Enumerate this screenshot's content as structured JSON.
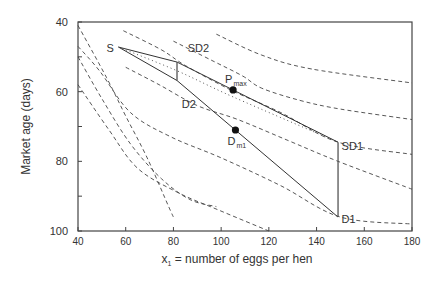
{
  "chart_data": {
    "type": "line",
    "title": "",
    "xlabel": "x",
    "xlabel_sub": "1",
    "xlabel_rest": " = number of eggs per hen",
    "ylabel": "Market age (days)",
    "xlim": [
      40,
      180
    ],
    "ylim": [
      40,
      100
    ],
    "y_inverted": true,
    "x_ticks": [
      40,
      60,
      80,
      100,
      120,
      140,
      160,
      180
    ],
    "x_tick_labels": [
      "40",
      "60",
      "80",
      "100",
      "120",
      "140",
      "160",
      "180"
    ],
    "y_major_ticks": [
      40,
      60,
      80,
      100
    ],
    "y_tick_labels": [
      "40",
      "60",
      "80",
      "100"
    ],
    "y_minor_ticks": [
      50,
      70,
      90
    ],
    "grid": false,
    "contours": [
      {
        "name": "contour-1",
        "points": [
          [
            40,
            41
          ],
          [
            52,
            56
          ],
          [
            60,
            67
          ],
          [
            69,
            79
          ],
          [
            78,
            93
          ],
          [
            80,
            96
          ]
        ]
      },
      {
        "name": "contour-2",
        "points": [
          [
            40,
            50
          ],
          [
            50,
            62
          ],
          [
            62,
            75
          ],
          [
            75,
            85
          ],
          [
            87,
            91
          ],
          [
            98,
            93
          ]
        ]
      },
      {
        "name": "contour-3",
        "points": [
          [
            40,
            58
          ],
          [
            53,
            71
          ],
          [
            65,
            82
          ],
          [
            82,
            89
          ],
          [
            99,
            94
          ],
          [
            120,
            100
          ]
        ]
      },
      {
        "name": "contour-4",
        "points": [
          [
            40,
            47
          ],
          [
            49,
            54
          ],
          [
            62,
            66
          ],
          [
            79,
            73
          ],
          [
            100,
            79
          ],
          [
            125,
            87
          ],
          [
            150,
            96
          ],
          [
            180,
            98
          ]
        ]
      },
      {
        "name": "contour-5",
        "points": [
          [
            60,
            53
          ],
          [
            74,
            58
          ],
          [
            90,
            64
          ],
          [
            107,
            68
          ],
          [
            128,
            74
          ],
          [
            149,
            80
          ],
          [
            180,
            88
          ]
        ]
      },
      {
        "name": "contour-6",
        "points": [
          [
            59,
            42.5
          ],
          [
            75,
            48
          ],
          [
            85,
            52.5
          ],
          [
            104,
            59.5
          ],
          [
            125,
            66
          ],
          [
            149,
            74.5
          ],
          [
            180,
            78
          ]
        ]
      },
      {
        "name": "contour-7",
        "points": [
          [
            80,
            45.5
          ],
          [
            96,
            51
          ],
          [
            109,
            55.5
          ],
          [
            117,
            59
          ],
          [
            133,
            62.5
          ],
          [
            150,
            65
          ],
          [
            180,
            68
          ]
        ]
      },
      {
        "name": "contour-8",
        "points": [
          [
            98,
            43.5
          ],
          [
            117,
            49.5
          ],
          [
            138,
            53.5
          ],
          [
            180,
            57.5
          ]
        ]
      }
    ],
    "upper_boundary": {
      "name": "S-SD2-SD1",
      "points": [
        [
          57,
          47.2
        ],
        [
          81.5,
          51.5
        ],
        [
          149,
          74.5
        ]
      ]
    },
    "lower_boundary": {
      "name": "S-D2-D1",
      "points": [
        [
          57,
          47.2
        ],
        [
          81.5,
          56.8
        ],
        [
          149,
          96
        ]
      ]
    },
    "vertical_segments": [
      {
        "name": "SD2-D2",
        "points": [
          [
            81.5,
            51.5
          ],
          [
            81.5,
            56.8
          ]
        ]
      },
      {
        "name": "SD1-D1",
        "points": [
          [
            149,
            74.5
          ],
          [
            149,
            96
          ]
        ]
      }
    ],
    "dotted_line": {
      "name": "optimum-path",
      "points": [
        [
          57,
          47.2
        ],
        [
          81.5,
          54
        ],
        [
          105,
          61.5
        ],
        [
          149,
          74.5
        ]
      ]
    },
    "points": [
      {
        "label": "P",
        "label_sub": "max",
        "x": 105,
        "y": 59.5
      },
      {
        "label": "D",
        "label_sub": "m1",
        "x": 106,
        "y": 71
      }
    ],
    "annotations": [
      {
        "text": "S",
        "x": 55,
        "y": 47.5
      },
      {
        "text": "SD2",
        "x": 86,
        "y": 47.5
      },
      {
        "text": "D2",
        "x": 83.5,
        "y": 63.5
      },
      {
        "text": "SD1",
        "x": 150.5,
        "y": 75.5
      },
      {
        "text": "D1",
        "x": 150.5,
        "y": 96.5
      }
    ]
  }
}
